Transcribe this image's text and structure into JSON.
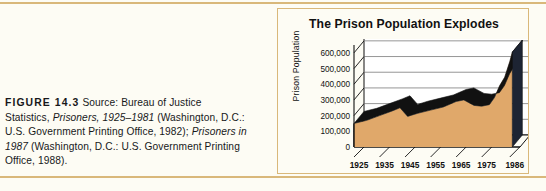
{
  "caption": {
    "figure_label": "FIGURE 14.3",
    "source_intro": "Source: Bureau of Justice Statistics,",
    "italic_1": "Prisoners, 1925–1981",
    "text_1": "(Washington, D.C.: U.S. Government Printing Office, 1982);",
    "italic_2": "Prisoners in 1987",
    "text_2": "(Washington, D.C.: U.S. Government Printing Office, 1988)."
  },
  "chart_data": {
    "type": "area",
    "title": "The Prison Population Explodes",
    "xlabel": "",
    "ylabel": "Prison Population",
    "ylim": [
      0,
      650000
    ],
    "xlim": [
      1925,
      1990
    ],
    "grid": true,
    "legend": "none",
    "style": "3d-area",
    "colors": {
      "area_fill": "#e0a86a",
      "area_edge": "#111111",
      "grid_line": "#8a8a8a",
      "axis_line": "#111111",
      "panel_border": "#d9b87a",
      "background": "#fdfcf4",
      "rule": "#d9b87a"
    },
    "ytick_labels": [
      "0",
      "100,000",
      "200,000",
      "300,000",
      "400,000",
      "500,000",
      "600,000"
    ],
    "ytick_values": [
      0,
      100000,
      200000,
      300000,
      400000,
      500000,
      600000
    ],
    "xtick_labels": [
      "1925",
      "1935",
      "1945",
      "1955",
      "1965",
      "1975",
      "1986"
    ],
    "xtick_values": [
      1925,
      1935,
      1945,
      1955,
      1965,
      1975,
      1986
    ],
    "x": [
      1925,
      1930,
      1935,
      1940,
      1943,
      1946,
      1950,
      1955,
      1960,
      1965,
      1968,
      1972,
      1975,
      1978,
      1980,
      1982,
      1984,
      1986,
      1987
    ],
    "values": [
      150000,
      170000,
      200000,
      230000,
      250000,
      195000,
      215000,
      235000,
      255000,
      290000,
      300000,
      265000,
      260000,
      270000,
      315000,
      390000,
      445000,
      545000,
      605000
    ],
    "series": [
      {
        "name": "Prison Population",
        "values": [
          150000,
          170000,
          200000,
          230000,
          250000,
          195000,
          215000,
          235000,
          255000,
          290000,
          300000,
          265000,
          260000,
          270000,
          315000,
          390000,
          445000,
          545000,
          605000
        ]
      }
    ]
  }
}
